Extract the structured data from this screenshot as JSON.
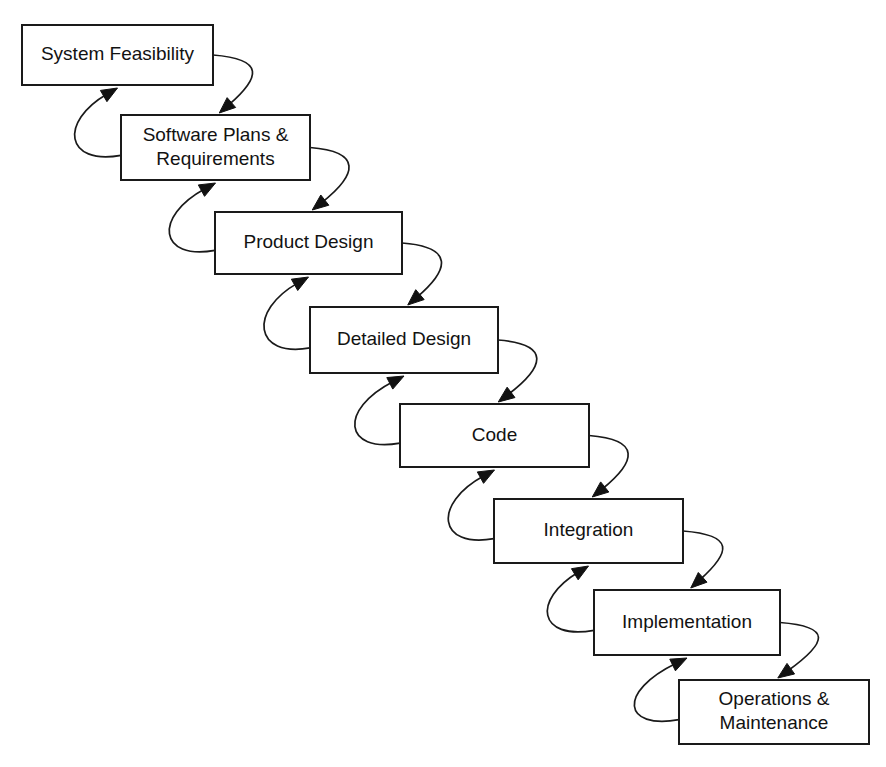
{
  "diagram": {
    "type": "flow-diagram",
    "background_color": "#ffffff",
    "box_fill_color": "#ffffff",
    "box_border_color": "#1a1a1a",
    "text_color": "#121212",
    "arrow_color": "#1a1a1a",
    "canvas": {
      "width": 886,
      "height": 767
    },
    "stages": [
      {
        "id": "system-feasibility",
        "label": "System Feasibility",
        "lines": [
          "System Feasibility"
        ],
        "x": 22,
        "y": 25,
        "width": 191,
        "height": 60
      },
      {
        "id": "software-plans-requirements",
        "label": "Software Plans & Requirements",
        "lines": [
          "Software Plans &",
          "Requirements"
        ],
        "x": 121,
        "y": 115,
        "width": 189,
        "height": 65
      },
      {
        "id": "product-design",
        "label": "Product Design",
        "lines": [
          "Product Design"
        ],
        "x": 215,
        "y": 212,
        "width": 187,
        "height": 62
      },
      {
        "id": "detailed-design",
        "label": "Detailed Design",
        "lines": [
          "Detailed Design"
        ],
        "x": 310,
        "y": 307,
        "width": 188,
        "height": 66
      },
      {
        "id": "code",
        "label": "Code",
        "lines": [
          "Code"
        ],
        "x": 400,
        "y": 404,
        "width": 189,
        "height": 63
      },
      {
        "id": "integration",
        "label": "Integration",
        "lines": [
          "Integration"
        ],
        "x": 494,
        "y": 499,
        "width": 189,
        "height": 64
      },
      {
        "id": "implementation",
        "label": "Implementation",
        "lines": [
          "Implementation"
        ],
        "x": 594,
        "y": 590,
        "width": 186,
        "height": 65
      },
      {
        "id": "operations-maintenance",
        "label": "Operations & Maintenance",
        "lines": [
          "Operations &",
          "Maintenance"
        ],
        "x": 679,
        "y": 680,
        "width": 190,
        "height": 64
      }
    ],
    "connections": [
      {
        "id": "forward-1",
        "direction": "forward",
        "from": "system-feasibility",
        "to": "software-plans-requirements"
      },
      {
        "id": "backward-1",
        "direction": "backward",
        "from": "software-plans-requirements",
        "to": "system-feasibility"
      },
      {
        "id": "forward-2",
        "direction": "forward",
        "from": "software-plans-requirements",
        "to": "product-design"
      },
      {
        "id": "backward-2",
        "direction": "backward",
        "from": "product-design",
        "to": "software-plans-requirements"
      },
      {
        "id": "forward-3",
        "direction": "forward",
        "from": "product-design",
        "to": "detailed-design"
      },
      {
        "id": "backward-3",
        "direction": "backward",
        "from": "detailed-design",
        "to": "product-design"
      },
      {
        "id": "forward-4",
        "direction": "forward",
        "from": "detailed-design",
        "to": "code"
      },
      {
        "id": "backward-4",
        "direction": "backward",
        "from": "code",
        "to": "detailed-design"
      },
      {
        "id": "forward-5",
        "direction": "forward",
        "from": "code",
        "to": "integration"
      },
      {
        "id": "backward-5",
        "direction": "backward",
        "from": "integration",
        "to": "code"
      },
      {
        "id": "forward-6",
        "direction": "forward",
        "from": "integration",
        "to": "implementation"
      },
      {
        "id": "backward-6",
        "direction": "backward",
        "from": "implementation",
        "to": "integration"
      },
      {
        "id": "forward-7",
        "direction": "forward",
        "from": "implementation",
        "to": "operations-maintenance"
      },
      {
        "id": "backward-7",
        "direction": "backward",
        "from": "operations-maintenance",
        "to": "implementation"
      }
    ]
  }
}
